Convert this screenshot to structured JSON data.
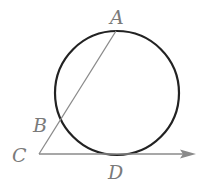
{
  "diagram": {
    "circle": {
      "cx": 117,
      "cy": 93,
      "r": 62,
      "stroke": "#222222"
    },
    "points": {
      "A": {
        "label": "A",
        "x": 116,
        "y": 31
      },
      "B": {
        "label": "B",
        "x": 59,
        "y": 122
      },
      "C": {
        "label": "C",
        "x": 39,
        "y": 154
      },
      "D": {
        "label": "D",
        "x": 116,
        "y": 155
      }
    },
    "segments": [
      {
        "name": "secant-CA",
        "from": "C",
        "to": "A",
        "color": "#8a8a8a"
      }
    ],
    "rays": [
      {
        "name": "tangent-ray-CD",
        "from": "C",
        "through": "D",
        "end_x": 196,
        "color": "#8a8a8a"
      }
    ],
    "label_color": "#7a7a7a"
  }
}
